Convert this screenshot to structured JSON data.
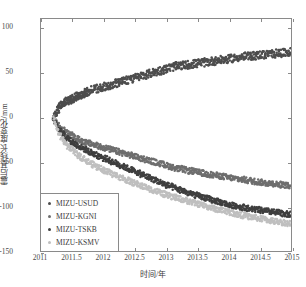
{
  "chart_data": {
    "type": "scatter",
    "title": "",
    "xlabel": "时间/年",
    "ylabel": "震后基线长度变化/mm",
    "xlim": [
      2011,
      2015
    ],
    "ylim": [
      -150,
      110
    ],
    "xticks": [
      "2011",
      "2011.5",
      "2012",
      "2012.5",
      "2013",
      "2013.5",
      "2014",
      "2014.5",
      "2015"
    ],
    "xtick_values": [
      2011,
      2011.5,
      2012,
      2012.5,
      2013,
      2013.5,
      2014,
      2014.5,
      2015
    ],
    "yticks": [
      "100",
      "50",
      "0",
      "-50",
      "-100",
      "-150"
    ],
    "ytick_values": [
      100,
      50,
      0,
      -50,
      -100,
      -150
    ],
    "grid": false,
    "legend_position": "lower-left",
    "series": [
      {
        "name": "MIZU-USUD",
        "color": "#4d4d4d",
        "marker": "dot",
        "x": [
          2011.2,
          2011.22,
          2011.25,
          2011.28,
          2011.3,
          2011.33,
          2011.36,
          2011.39,
          2011.42,
          2011.45,
          2011.48,
          2011.51,
          2011.54,
          2011.57,
          2011.6,
          2011.63,
          2011.66,
          2011.69,
          2011.72,
          2011.75,
          2011.8,
          2011.85,
          2011.9,
          2011.95,
          2012.0,
          2012.05,
          2012.1,
          2012.15,
          2012.2,
          2012.25,
          2012.3,
          2012.35,
          2012.4,
          2012.45,
          2012.5,
          2012.55,
          2012.6,
          2012.65,
          2012.7,
          2012.75,
          2012.8,
          2012.85,
          2012.9,
          2012.95,
          2013.0,
          2013.05,
          2013.1,
          2013.15,
          2013.2,
          2013.25,
          2013.3,
          2013.35,
          2013.4,
          2013.45,
          2013.5,
          2013.55,
          2013.6,
          2013.65,
          2013.7,
          2013.75,
          2013.8,
          2013.85,
          2013.9,
          2013.95,
          2014.0,
          2014.05,
          2014.1,
          2014.15,
          2014.2,
          2014.25,
          2014.3,
          2014.35,
          2014.4,
          2014.45,
          2014.5,
          2014.55,
          2014.6,
          2014.65,
          2014.7,
          2014.75,
          2014.8,
          2014.85,
          2014.9,
          2014.95
        ],
        "y": [
          0,
          3,
          6,
          9,
          12,
          14,
          16,
          17,
          18,
          19,
          20,
          21,
          22,
          23,
          24,
          25,
          26,
          27,
          28,
          29,
          30,
          31,
          32,
          33,
          34,
          35,
          36,
          37,
          38,
          39,
          40,
          41,
          42,
          43,
          44,
          45,
          46,
          47,
          48,
          49,
          50,
          51,
          52,
          53,
          54,
          55,
          56,
          57,
          57,
          58,
          58,
          59,
          59,
          60,
          60,
          61,
          61,
          62,
          62,
          63,
          63,
          64,
          64,
          65,
          65,
          66,
          66,
          67,
          67,
          68,
          68,
          68,
          69,
          69,
          70,
          70,
          70,
          71,
          71,
          71,
          72,
          72,
          72,
          73
        ]
      },
      {
        "name": "MIZU-KGNI",
        "color": "#6e6e6e",
        "marker": "dot",
        "x": [
          2011.2,
          2011.25,
          2011.3,
          2011.35,
          2011.4,
          2011.45,
          2011.5,
          2011.55,
          2011.6,
          2011.65,
          2011.7,
          2011.75,
          2011.8,
          2011.85,
          2011.9,
          2011.95,
          2012.0,
          2012.05,
          2012.1,
          2012.15,
          2012.2,
          2012.25,
          2012.3,
          2012.35,
          2012.4,
          2012.45,
          2012.5,
          2012.55,
          2012.6,
          2012.65,
          2012.7,
          2012.75,
          2012.8,
          2012.85,
          2012.9,
          2012.95,
          2013.0,
          2013.05,
          2013.1,
          2013.15,
          2013.2,
          2013.25,
          2013.3,
          2013.35,
          2013.4,
          2013.45,
          2013.5,
          2013.55,
          2013.6,
          2013.65,
          2013.7,
          2013.75,
          2013.8,
          2013.85,
          2013.9,
          2013.95,
          2014.0,
          2014.05,
          2014.1,
          2014.15,
          2014.2,
          2014.25,
          2014.3,
          2014.35,
          2014.4,
          2014.45,
          2014.5,
          2014.55,
          2014.6,
          2014.65,
          2014.7,
          2014.75,
          2014.8,
          2014.85,
          2014.9,
          2014.95
        ],
        "y": [
          0,
          -7,
          -11,
          -14,
          -17,
          -19,
          -21,
          -23,
          -25,
          -26,
          -28,
          -29,
          -30,
          -31,
          -32,
          -33,
          -34,
          -35,
          -36,
          -37,
          -38,
          -39,
          -40,
          -41,
          -42,
          -43,
          -44,
          -45,
          -46,
          -47,
          -48,
          -49,
          -50,
          -51,
          -52,
          -53,
          -54,
          -55,
          -56,
          -57,
          -58,
          -58,
          -59,
          -60,
          -60,
          -61,
          -62,
          -62,
          -63,
          -64,
          -64,
          -65,
          -65,
          -66,
          -66,
          -67,
          -68,
          -68,
          -69,
          -69,
          -70,
          -70,
          -71,
          -71,
          -72,
          -72,
          -73,
          -73,
          -74,
          -74,
          -74,
          -75,
          -75,
          -76,
          -76,
          -77
        ]
      },
      {
        "name": "MIZU-TSKB",
        "color": "#3f3f3f",
        "marker": "dot",
        "x": [
          2011.2,
          2011.25,
          2011.3,
          2011.35,
          2011.4,
          2011.45,
          2011.5,
          2011.55,
          2011.6,
          2011.65,
          2011.7,
          2011.75,
          2011.8,
          2011.85,
          2011.9,
          2011.95,
          2012.0,
          2012.05,
          2012.1,
          2012.15,
          2012.2,
          2012.25,
          2012.3,
          2012.35,
          2012.4,
          2012.45,
          2012.5,
          2012.55,
          2012.6,
          2012.65,
          2012.7,
          2012.75,
          2012.8,
          2012.85,
          2012.9,
          2012.95,
          2013.0,
          2013.05,
          2013.1,
          2013.15,
          2013.2,
          2013.25,
          2013.3,
          2013.35,
          2013.4,
          2013.45,
          2013.5,
          2013.55,
          2013.6,
          2013.65,
          2013.7,
          2013.75,
          2013.8,
          2013.85,
          2013.9,
          2013.95,
          2014.0,
          2014.05,
          2014.1,
          2014.15,
          2014.2,
          2014.25,
          2014.3,
          2014.35,
          2014.4,
          2014.45,
          2014.5,
          2014.55,
          2014.6,
          2014.65,
          2014.7,
          2014.75,
          2014.8,
          2014.85,
          2014.9,
          2014.95
        ],
        "y": [
          0,
          -9,
          -14,
          -18,
          -22,
          -25,
          -28,
          -30,
          -32,
          -34,
          -36,
          -38,
          -40,
          -41,
          -43,
          -44,
          -46,
          -47,
          -49,
          -50,
          -52,
          -53,
          -55,
          -56,
          -58,
          -59,
          -61,
          -62,
          -64,
          -65,
          -67,
          -68,
          -70,
          -71,
          -73,
          -74,
          -76,
          -77,
          -78,
          -80,
          -81,
          -82,
          -83,
          -85,
          -86,
          -87,
          -88,
          -89,
          -90,
          -91,
          -92,
          -93,
          -94,
          -95,
          -96,
          -97,
          -98,
          -99,
          -99,
          -100,
          -101,
          -101,
          -102,
          -103,
          -103,
          -104,
          -104,
          -105,
          -105,
          -106,
          -106,
          -107,
          -107,
          -108,
          -108,
          -109
        ]
      },
      {
        "name": "MIZU-KSMV",
        "color": "#bfbfbf",
        "marker": "dot",
        "x": [
          2011.2,
          2011.25,
          2011.3,
          2011.35,
          2011.4,
          2011.45,
          2011.5,
          2011.55,
          2011.6,
          2011.65,
          2011.7,
          2011.75,
          2011.8,
          2011.85,
          2011.9,
          2011.95,
          2012.0,
          2012.05,
          2012.1,
          2012.15,
          2012.2,
          2012.25,
          2012.3,
          2012.35,
          2012.4,
          2012.45,
          2012.5,
          2012.55,
          2012.6,
          2012.65,
          2012.7,
          2012.75,
          2012.8,
          2012.85,
          2012.9,
          2012.95,
          2013.0,
          2013.05,
          2013.1,
          2013.15,
          2013.2,
          2013.25,
          2013.3,
          2013.35,
          2013.4,
          2013.45,
          2013.5,
          2013.55,
          2013.6,
          2013.65,
          2013.7,
          2013.75,
          2013.8,
          2013.85,
          2013.9,
          2013.95,
          2014.0,
          2014.05,
          2014.1,
          2014.15,
          2014.2,
          2014.25,
          2014.3,
          2014.35,
          2014.4,
          2014.45,
          2014.5,
          2014.55,
          2014.6,
          2014.65,
          2014.7,
          2014.75,
          2014.8,
          2014.85,
          2014.9,
          2014.95
        ],
        "y": [
          0,
          -13,
          -20,
          -25,
          -30,
          -34,
          -37,
          -40,
          -43,
          -45,
          -47,
          -50,
          -52,
          -54,
          -56,
          -57,
          -59,
          -61,
          -62,
          -64,
          -65,
          -67,
          -68,
          -70,
          -71,
          -73,
          -74,
          -75,
          -77,
          -78,
          -79,
          -81,
          -82,
          -83,
          -84,
          -86,
          -87,
          -88,
          -89,
          -90,
          -91,
          -92,
          -93,
          -94,
          -95,
          -96,
          -97,
          -98,
          -99,
          -100,
          -101,
          -102,
          -103,
          -104,
          -104,
          -105,
          -106,
          -107,
          -108,
          -109,
          -110,
          -110,
          -111,
          -112,
          -112,
          -113,
          -114,
          -114,
          -115,
          -116,
          -116,
          -117,
          -117,
          -118,
          -118,
          -119
        ]
      }
    ]
  },
  "legend": {
    "items": [
      {
        "label": "MIZU-USUD"
      },
      {
        "label": "MIZU-KGNI"
      },
      {
        "label": "MIZU-TSKB"
      },
      {
        "label": "MIZU-KSMV"
      }
    ]
  }
}
